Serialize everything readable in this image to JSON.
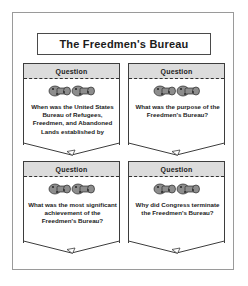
{
  "title": "The Freedmen's Bureau",
  "colors": {
    "page_border": "#9a9a9a",
    "card_border": "#3d3d3d",
    "header_band": "#dcdcdc",
    "text": "#1b1b1b"
  },
  "cards": [
    {
      "header": "Question",
      "icon": "cannon-ornament-icon",
      "question": "When was the United States Bureau of Refugees, Freedmen, and Abandoned Lands established by Congress?"
    },
    {
      "header": "Question",
      "icon": "cannon-ornament-icon",
      "question": "What was the purpose of the Freedmen's Bureau?"
    },
    {
      "header": "Question",
      "icon": "cannon-ornament-icon",
      "question": "What was the most significant achievement of the Freedmen's Bureau?"
    },
    {
      "header": "Question",
      "icon": "cannon-ornament-icon",
      "question": "Why did Congress terminate the Freedmen's Bureau?"
    }
  ]
}
